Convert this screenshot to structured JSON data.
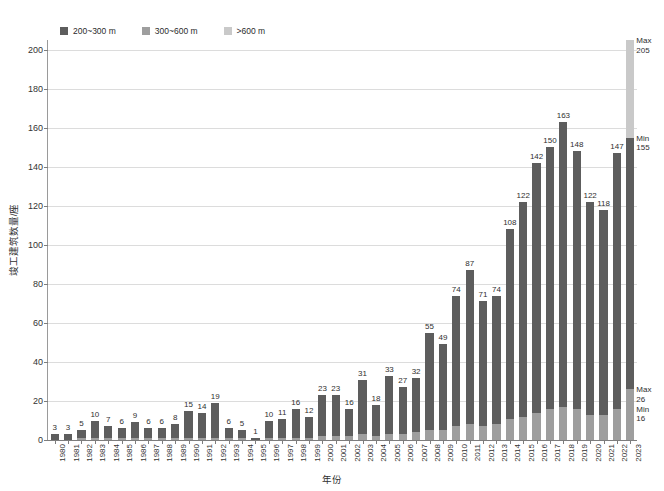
{
  "chart_data": {
    "type": "bar",
    "subtype": "stacked-bar",
    "title": "",
    "xlabel": "年份",
    "ylabel": "竣工建筑数量/座",
    "ylim": [
      0,
      205
    ],
    "yticks": [
      0,
      20,
      40,
      60,
      80,
      100,
      120,
      140,
      160,
      180,
      200
    ],
    "grid": "horizontal",
    "legend_position": "top-left",
    "categories": [
      "1980",
      "1981",
      "1982",
      "1983",
      "1984",
      "1985",
      "1986",
      "1987",
      "1988",
      "1989",
      "1990",
      "1991",
      "1992",
      "1993",
      "1994",
      "1995",
      "1996",
      "1997",
      "1998",
      "1999",
      "2000",
      "2001",
      "2002",
      "2003",
      "2004",
      "2005",
      "2006",
      "2007",
      "2008",
      "2009",
      "2010",
      "2011",
      "2012",
      "2013",
      "2014",
      "2015",
      "2016",
      "2017",
      "2018",
      "2019",
      "2020",
      "2021",
      "2022",
      "2023"
    ],
    "series": [
      {
        "name": "200~300 m",
        "color": "#5d5d5d",
        "values": [
          3,
          3,
          4,
          9,
          6,
          5,
          8,
          5,
          5,
          7,
          14,
          13,
          18,
          5,
          4,
          1,
          9,
          10,
          15,
          11,
          21,
          21,
          14,
          28,
          16,
          30,
          24,
          28,
          50,
          44,
          67,
          79,
          64,
          66,
          97,
          110,
          128,
          134,
          146,
          132,
          109,
          105,
          131,
          129
        ]
      },
      {
        "name": "300~600 m",
        "color": "#9e9e9e",
        "values": [
          0,
          0,
          1,
          1,
          1,
          1,
          1,
          1,
          1,
          1,
          1,
          1,
          1,
          1,
          1,
          0,
          1,
          1,
          1,
          1,
          2,
          2,
          2,
          3,
          2,
          3,
          3,
          4,
          5,
          5,
          7,
          8,
          7,
          8,
          11,
          12,
          14,
          16,
          17,
          16,
          13,
          13,
          16,
          26
        ]
      },
      {
        "name": ">600 m",
        "color": "#c9c9c9",
        "values": [
          0,
          0,
          0,
          0,
          0,
          0,
          0,
          0,
          0,
          0,
          0,
          0,
          0,
          0,
          0,
          0,
          0,
          0,
          0,
          0,
          0,
          0,
          0,
          0,
          0,
          0,
          0,
          0,
          0,
          0,
          0,
          0,
          0,
          0,
          0,
          0,
          0,
          0,
          0,
          0,
          0,
          0,
          0,
          50
        ]
      }
    ],
    "totals": [
      3,
      3,
      5,
      10,
      7,
      6,
      9,
      6,
      6,
      8,
      15,
      14,
      19,
      6,
      5,
      1,
      10,
      11,
      16,
      12,
      23,
      23,
      16,
      31,
      18,
      33,
      27,
      32,
      55,
      49,
      74,
      87,
      71,
      74,
      108,
      122,
      142,
      150,
      163,
      148,
      122,
      118,
      147,
      205
    ],
    "bar_labels": [
      "3",
      "3",
      "5",
      "10",
      "7",
      "6",
      "9",
      "6",
      "6",
      "8",
      "15",
      "14",
      "19",
      "6",
      "5",
      "1",
      "10",
      "11",
      "16",
      "12",
      "23",
      "23",
      "16",
      "31",
      "18",
      "33",
      "27",
      "32",
      "55",
      "49",
      "74",
      "87",
      "71",
      "74",
      "108",
      "122",
      "142",
      "150",
      "163",
      "148",
      "122",
      "118",
      "147",
      ""
    ],
    "annotations": [
      {
        "id": "max-top",
        "label": "Max",
        "value": "205",
        "category": "2023",
        "at": 205
      },
      {
        "id": "min-top",
        "label": "Min",
        "value": "155",
        "category": "2023",
        "at": 155
      },
      {
        "id": "max-bottom",
        "label": "Max",
        "value": "26",
        "category": "2023",
        "at": 26
      },
      {
        "id": "min-bottom",
        "label": "Min",
        "value": "16",
        "category": "2023",
        "at": 16
      }
    ]
  },
  "legend": {
    "items": [
      {
        "label": "200~300 m",
        "color": "#5d5d5d"
      },
      {
        "label": "300~600 m",
        "color": "#9e9e9e"
      },
      {
        "label": ">600 m",
        "color": "#c9c9c9"
      }
    ]
  },
  "colors": {
    "band_200_300": "#5d5d5d",
    "band_300_600": "#9e9e9e",
    "band_over_600": "#c9c9c9",
    "gridline": "#dcdcdc",
    "axis": "#7d7d7d",
    "text": "#2f2f2f",
    "background": "#ffffff"
  }
}
